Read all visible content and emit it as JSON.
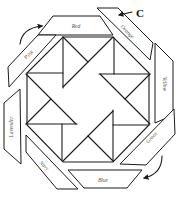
{
  "diagram": {
    "title": "",
    "callout_letter": "C",
    "strips": [
      {
        "name": "Red",
        "points": "53,16 100,16 113,35 38,35",
        "label_x": 76,
        "label_y": 27,
        "rotate": 0
      },
      {
        "name": "Orange",
        "points": "97,8 118,8 153,43 150,60",
        "label_x": 127,
        "label_y": 32,
        "rotate": 45
      },
      {
        "name": "Yellow",
        "points": "155,43 173,61 173,115 155,123",
        "label_x": 164,
        "label_y": 84,
        "rotate": 90
      },
      {
        "name": "Green",
        "points": "174,109 175,134 146,165 120,164",
        "label_x": 152,
        "label_y": 138,
        "rotate": -45
      },
      {
        "name": "Blue",
        "points": "68,170 142,170 127,188 84,188",
        "label_x": 103,
        "label_y": 181,
        "rotate": 0
      },
      {
        "name": "Navy",
        "points": "26,135 78,189 57,189 26,152",
        "label_x": 44,
        "label_y": 166,
        "rotate": 45
      },
      {
        "name": "Lavender",
        "points": "4,103 20,89 21,164 4,149",
        "label_x": 12,
        "label_y": 127,
        "rotate": -90
      },
      {
        "name": "Pink",
        "points": "8,67 38,35 56,35 9,87",
        "label_x": 29,
        "label_y": 55,
        "rotate": -45
      }
    ],
    "octagon": "63,37 113,37 149,73 149,125 113,162 63,162 27,125 27,73",
    "center": [
      88,
      99
    ],
    "arrows": [
      {
        "name": "curved-arrow-top-left",
        "path": "M20,44 Q22,28 42,26"
      },
      {
        "name": "curved-arrow-bottom-right",
        "path": "M162,156 Q162,174 144,178"
      },
      {
        "name": "c-pointer-arrow",
        "path": "M132,12 L119,15"
      }
    ]
  }
}
